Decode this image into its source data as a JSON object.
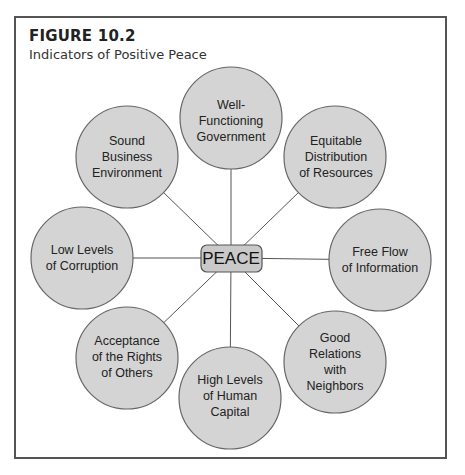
{
  "figure": {
    "number": "FIGURE 10.2",
    "title": "Indicators of Positive Peace"
  },
  "center": {
    "label": "PEACE"
  },
  "nodes": [
    {
      "id": "government",
      "label": "Well-\nFunctioning\nGovernment",
      "lines": [
        "Well-",
        "Functioning",
        "Government"
      ]
    },
    {
      "id": "resources",
      "label": "Equitable Distribution of Resources",
      "lines": [
        "Equitable",
        "Distribution",
        "of Resources"
      ]
    },
    {
      "id": "information",
      "label": "Free Flow of Information",
      "lines": [
        "Free Flow",
        "of Information"
      ]
    },
    {
      "id": "neighbors",
      "label": "Good Relations with Neighbors",
      "lines": [
        "Good",
        "Relations",
        "with",
        "Neighbors"
      ]
    },
    {
      "id": "human-capital",
      "label": "High Levels of Human Capital",
      "lines": [
        "High Levels",
        "of Human",
        "Capital"
      ]
    },
    {
      "id": "rights",
      "label": "Acceptance of the Rights of Others",
      "lines": [
        "Acceptance",
        "of the Rights",
        "of Others"
      ]
    },
    {
      "id": "corruption",
      "label": "Low Levels of Corruption",
      "lines": [
        "Low Levels",
        "of Corruption"
      ]
    },
    {
      "id": "business",
      "label": "Sound Business Environment",
      "lines": [
        "Sound",
        "Business",
        "Environment"
      ]
    }
  ],
  "colors": {
    "circle_fill": "#d4d4d4",
    "circle_stroke": "#666666",
    "box_fill": "#c9c9c9",
    "line": "#555555"
  }
}
